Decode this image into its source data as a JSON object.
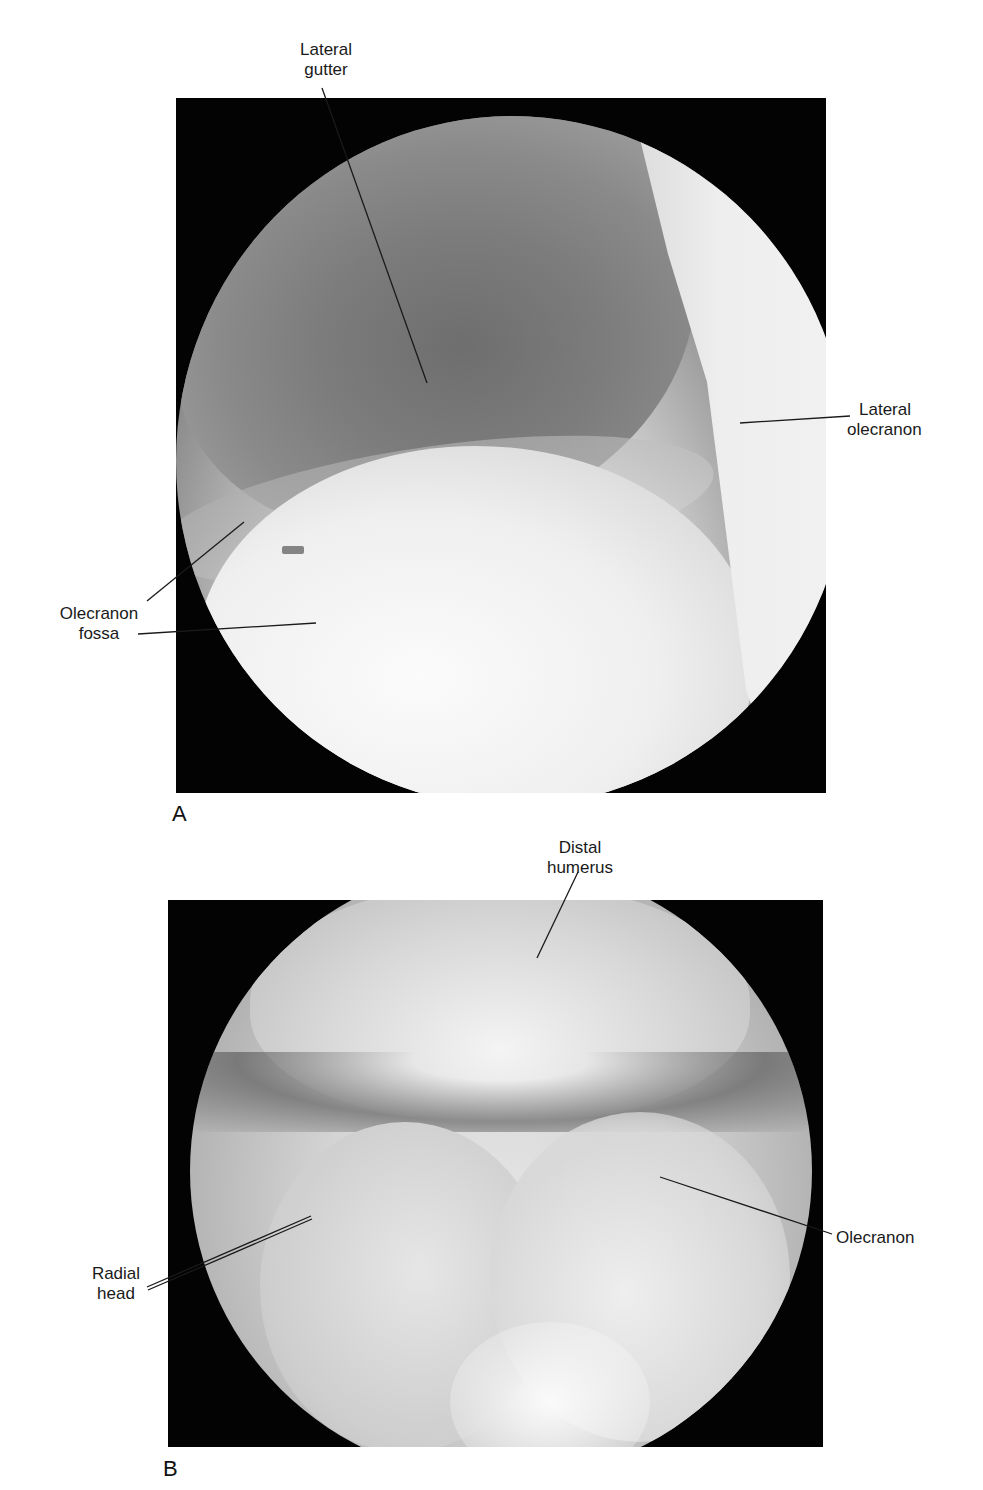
{
  "figure": {
    "panels": [
      {
        "letter": "A",
        "description": "Arthroscopic view (posterior elbow)",
        "labels": [
          {
            "line1": "Lateral",
            "line2": "gutter"
          },
          {
            "line1": "Lateral",
            "line2": "olecranon"
          },
          {
            "line1": "Olecranon",
            "line2": "fossa"
          }
        ]
      },
      {
        "letter": "B",
        "description": "Arthroscopic view (elbow joint)",
        "labels": [
          {
            "line1": "Distal",
            "line2": "humerus"
          },
          {
            "line1": "Olecranon",
            "line2": ""
          },
          {
            "line1": "Radial",
            "line2": "head"
          }
        ]
      }
    ]
  }
}
